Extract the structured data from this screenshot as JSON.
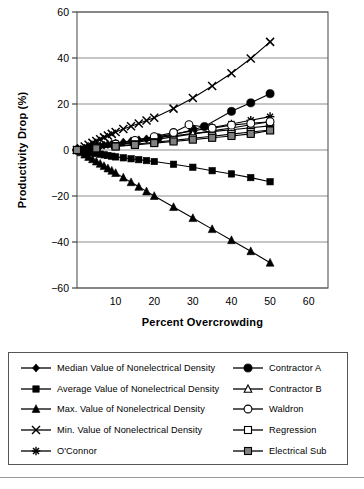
{
  "chart_data": {
    "type": "line",
    "title": "",
    "xlabel": "Percent Overcrowding",
    "ylabel": "Productivity Drop (%)",
    "xlim": [
      0,
      65
    ],
    "ylim": [
      -60,
      60
    ],
    "xticks": [
      10,
      20,
      30,
      40,
      50,
      60
    ],
    "yticks": [
      60,
      40,
      20,
      0,
      -20,
      -40,
      -60
    ],
    "grid": "horizontal",
    "legend_position": "below",
    "series": [
      {
        "name": "Median Value of Nonelectrical Density",
        "marker": "filled-diamond",
        "x": [
          0,
          1,
          2,
          3,
          4,
          5,
          6,
          7,
          8,
          9,
          10,
          12,
          14,
          16,
          18,
          20,
          25,
          30,
          35,
          40,
          45,
          50
        ],
        "y": [
          0,
          0.3,
          0.6,
          0.9,
          1.2,
          1.5,
          1.8,
          2.1,
          2.4,
          2.6,
          2.9,
          3.4,
          3.9,
          4.4,
          4.8,
          5.2,
          6.2,
          7.1,
          8.0,
          8.8,
          9.7,
          10.5
        ]
      },
      {
        "name": "Average Value of Nonelectrical Density",
        "marker": "filled-square",
        "x": [
          0,
          1,
          2,
          3,
          4,
          5,
          6,
          7,
          8,
          9,
          10,
          12,
          14,
          16,
          18,
          20,
          25,
          30,
          35,
          40,
          45,
          50
        ],
        "y": [
          0,
          -0.3,
          -0.6,
          -0.9,
          -1.2,
          -1.5,
          -1.8,
          -2.1,
          -2.4,
          -2.7,
          -3.0,
          -3.4,
          -3.8,
          -4.2,
          -4.6,
          -5.0,
          -6.2,
          -7.5,
          -9.0,
          -10.4,
          -12.0,
          -13.8
        ]
      },
      {
        "name": "Max. Value of Nonelectrical Density",
        "marker": "filled-triangle",
        "x": [
          0,
          1,
          2,
          3,
          4,
          5,
          6,
          7,
          8,
          9,
          10,
          12,
          14,
          16,
          18,
          20,
          25,
          30,
          35,
          40,
          45,
          50
        ],
        "y": [
          0,
          -1.0,
          -2.0,
          -3.0,
          -4.0,
          -5.0,
          -6.0,
          -7.0,
          -8.0,
          -9.0,
          -10.0,
          -12.0,
          -14.0,
          -16.0,
          -18.0,
          -20.0,
          -24.8,
          -29.6,
          -34.4,
          -39.2,
          -44.0,
          -49.0
        ]
      },
      {
        "name": "Min. Value of Nonelectrical Density",
        "marker": "cross-x",
        "x": [
          0,
          1,
          2,
          3,
          4,
          5,
          6,
          7,
          8,
          9,
          10,
          12,
          14,
          16,
          18,
          20,
          25,
          30,
          35,
          40,
          45,
          50
        ],
        "y": [
          0,
          0.7,
          1.5,
          2.3,
          3.1,
          3.9,
          4.7,
          5.5,
          6.3,
          7.0,
          7.8,
          9.1,
          10.3,
          11.5,
          12.8,
          14.0,
          18.0,
          22.6,
          27.8,
          33.4,
          39.8,
          47.0
        ]
      },
      {
        "name": "O'Connor",
        "marker": "asterisk",
        "x": [
          0,
          5,
          10,
          15,
          20,
          25,
          30,
          35,
          40,
          45,
          50
        ],
        "y": [
          0,
          1.3,
          2.7,
          4.1,
          5.5,
          6.9,
          8.3,
          9.8,
          11.3,
          12.9,
          14.5
        ]
      },
      {
        "name": "Contractor A",
        "marker": "filled-circle",
        "x": [
          0,
          5,
          10,
          15,
          21,
          25,
          30,
          33,
          40,
          45,
          50
        ],
        "y": [
          0,
          1.1,
          2.3,
          3.6,
          5.3,
          6.6,
          8.8,
          10.2,
          16.8,
          20.5,
          24.5
        ]
      },
      {
        "name": "Contractor B",
        "marker": "open-triangle",
        "x": [
          0,
          5,
          10,
          15,
          20,
          25,
          30,
          35,
          40,
          45,
          50
        ],
        "y": [
          0,
          1.0,
          2.1,
          3.3,
          4.5,
          5.7,
          7.0,
          8.3,
          9.6,
          11.0,
          12.3
        ]
      },
      {
        "name": "Waldron",
        "marker": "open-circle",
        "x": [
          0,
          5,
          10,
          15,
          20,
          25,
          29,
          35,
          40,
          45,
          50
        ],
        "y": [
          0,
          1.2,
          2.6,
          4.2,
          5.8,
          7.6,
          11.0,
          9.5,
          10.8,
          11.6,
          12.3
        ]
      },
      {
        "name": "Regression",
        "marker": "open-square",
        "x": [
          0,
          5,
          10,
          15,
          20,
          25,
          30,
          35,
          40,
          45,
          50
        ],
        "y": [
          0,
          0.8,
          1.7,
          2.5,
          3.4,
          4.2,
          5.1,
          6.0,
          6.9,
          7.8,
          8.7
        ]
      },
      {
        "name": "Electrical Sub",
        "marker": "gray-square",
        "x": [
          0,
          5,
          10,
          15,
          20,
          25,
          30,
          35,
          40,
          45,
          50
        ],
        "y": [
          0,
          0.7,
          1.5,
          2.2,
          3.0,
          3.7,
          4.5,
          5.3,
          6.1,
          7.0,
          8.5
        ]
      }
    ]
  },
  "axes": {
    "y_label": "Productivity Drop (%)",
    "x_label": "Percent Overcrowding",
    "y_ticks": [
      "60",
      "40",
      "20",
      "0",
      "−20",
      "−40",
      "−60"
    ],
    "x_ticks": [
      "10",
      "20",
      "30",
      "40",
      "50",
      "60"
    ]
  },
  "legend": {
    "left_column": [
      {
        "label": "Median Value of Nonelectrical Density",
        "marker": "filled-diamond"
      },
      {
        "label": "Average Value of Nonelectrical Density",
        "marker": "filled-square"
      },
      {
        "label": "Max. Value of Nonelectrical Density",
        "marker": "filled-triangle"
      },
      {
        "label": "Min. Value of Nonelectrical Density",
        "marker": "cross-x"
      },
      {
        "label": "O'Connor",
        "marker": "asterisk"
      }
    ],
    "right_column": [
      {
        "label": "Contractor A",
        "marker": "filled-circle"
      },
      {
        "label": "Contractor B",
        "marker": "open-triangle"
      },
      {
        "label": "Waldron",
        "marker": "open-circle"
      },
      {
        "label": "Regression",
        "marker": "open-square"
      },
      {
        "label": "Electrical Sub",
        "marker": "gray-square"
      }
    ]
  },
  "colors": {
    "line": "#000000",
    "grid": "#808080",
    "frame": "#555555",
    "gray_fill": "#808080",
    "background": "#ffffff"
  }
}
